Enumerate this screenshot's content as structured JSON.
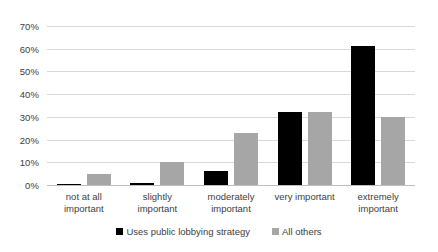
{
  "chart_data": {
    "type": "bar",
    "title": "",
    "subtitle": "",
    "xlabel": "",
    "ylabel": "",
    "ylim": [
      0,
      70
    ],
    "ytick_labels": [
      "70%",
      "60%",
      "50%",
      "40%",
      "30%",
      "20%",
      "10%",
      "0%"
    ],
    "ytick_values": [
      70,
      60,
      50,
      40,
      30,
      20,
      10,
      0
    ],
    "grid": true,
    "legend_position": "bottom",
    "categories": [
      "not at all important",
      "slightly important",
      "moderately important",
      "very important",
      "extremely important"
    ],
    "category_lines": [
      [
        "not at all",
        "important"
      ],
      [
        "slightly important"
      ],
      [
        "moderately",
        "important"
      ],
      [
        "very important"
      ],
      [
        "extremely",
        "important"
      ]
    ],
    "series": [
      {
        "name": "Uses public lobbying strategy",
        "color": "#000000",
        "values": [
          0.5,
          1,
          6,
          32,
          61
        ]
      },
      {
        "name": "All others",
        "color": "#a6a6a6",
        "values": [
          5,
          10,
          23,
          32,
          30
        ]
      }
    ]
  }
}
